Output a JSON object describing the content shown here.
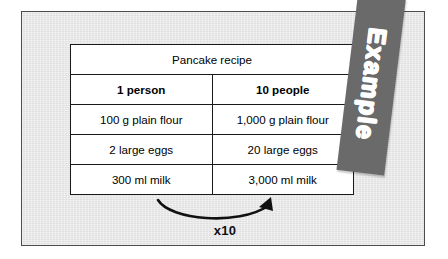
{
  "panel": {
    "background_color": "#e6e6e6",
    "border_color": "#4c4c4c"
  },
  "table": {
    "title": "Pancake recipe",
    "title_background": "#e4e4e4",
    "columns": [
      "1 person",
      "10 people"
    ],
    "rows": [
      [
        "100 g plain flour",
        "1,000 g plain flour"
      ],
      [
        "2 large eggs",
        "20 large eggs"
      ],
      [
        "300 ml milk",
        "3,000 ml milk"
      ]
    ]
  },
  "annotation": {
    "multiplier_label": "x10",
    "arrow_icon": "curved-arrow-right-icon"
  },
  "banner": {
    "label": "Example",
    "background_color": "#6a6a6a",
    "text_color": "#ffffff"
  }
}
